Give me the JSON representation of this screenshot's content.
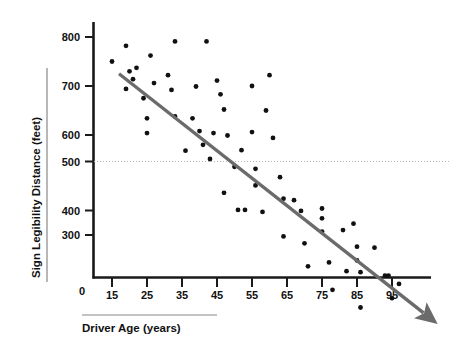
{
  "chart_data": {
    "type": "scatter",
    "title": "",
    "xlabel": "Driver Age (years)",
    "ylabel": "Sign Legibility Distance (feet)",
    "xlim": [
      5,
      105
    ],
    "ylim": [
      200,
      830
    ],
    "x_ticks": [
      15,
      25,
      35,
      45,
      55,
      65,
      75,
      85,
      95
    ],
    "y_ticks": [
      300,
      400,
      500,
      600,
      700,
      800
    ],
    "origin_label": "0",
    "grid": false,
    "legend": null,
    "reference_line": {
      "orientation": "horizontal",
      "value": 500,
      "style": "dotted",
      "color": "#b0b0b0"
    },
    "trend_line": {
      "style": "solid-arrow",
      "color": "#6b6b6b",
      "start": [
        17,
        725
      ],
      "end": [
        104,
        237
      ],
      "description": "negative linear trend with arrowhead at right end"
    },
    "point_color": "#111111",
    "point_radius": 2.4,
    "points": [
      {
        "x": 15,
        "y": 750
      },
      {
        "x": 19,
        "y": 782
      },
      {
        "x": 19,
        "y": 694
      },
      {
        "x": 20,
        "y": 730
      },
      {
        "x": 21,
        "y": 714
      },
      {
        "x": 22,
        "y": 737
      },
      {
        "x": 24,
        "y": 675
      },
      {
        "x": 25,
        "y": 634
      },
      {
        "x": 25,
        "y": 604
      },
      {
        "x": 26,
        "y": 762
      },
      {
        "x": 27,
        "y": 706
      },
      {
        "x": 31,
        "y": 722
      },
      {
        "x": 32,
        "y": 692
      },
      {
        "x": 33,
        "y": 791
      },
      {
        "x": 33,
        "y": 638
      },
      {
        "x": 36,
        "y": 568
      },
      {
        "x": 38,
        "y": 634
      },
      {
        "x": 39,
        "y": 699
      },
      {
        "x": 40,
        "y": 608
      },
      {
        "x": 41,
        "y": 580
      },
      {
        "x": 42,
        "y": 791
      },
      {
        "x": 43,
        "y": 551
      },
      {
        "x": 44,
        "y": 604
      },
      {
        "x": 45,
        "y": 711
      },
      {
        "x": 46,
        "y": 683
      },
      {
        "x": 47,
        "y": 652
      },
      {
        "x": 47,
        "y": 482
      },
      {
        "x": 48,
        "y": 599
      },
      {
        "x": 50,
        "y": 535
      },
      {
        "x": 51,
        "y": 447
      },
      {
        "x": 52,
        "y": 569
      },
      {
        "x": 53,
        "y": 447
      },
      {
        "x": 55,
        "y": 700
      },
      {
        "x": 55,
        "y": 606
      },
      {
        "x": 56,
        "y": 531
      },
      {
        "x": 56,
        "y": 497
      },
      {
        "x": 58,
        "y": 443
      },
      {
        "x": 59,
        "y": 650
      },
      {
        "x": 60,
        "y": 722
      },
      {
        "x": 61,
        "y": 594
      },
      {
        "x": 63,
        "y": 514
      },
      {
        "x": 64,
        "y": 470
      },
      {
        "x": 64,
        "y": 393
      },
      {
        "x": 67,
        "y": 467
      },
      {
        "x": 69,
        "y": 445
      },
      {
        "x": 70,
        "y": 379
      },
      {
        "x": 71,
        "y": 332
      },
      {
        "x": 75,
        "y": 450
      },
      {
        "x": 75,
        "y": 430
      },
      {
        "x": 75,
        "y": 403
      },
      {
        "x": 77,
        "y": 340
      },
      {
        "x": 78,
        "y": 284
      },
      {
        "x": 81,
        "y": 406
      },
      {
        "x": 82,
        "y": 322
      },
      {
        "x": 84,
        "y": 419
      },
      {
        "x": 85,
        "y": 372
      },
      {
        "x": 85,
        "y": 344
      },
      {
        "x": 86,
        "y": 320
      },
      {
        "x": 86,
        "y": 248
      },
      {
        "x": 90,
        "y": 370
      },
      {
        "x": 93,
        "y": 313
      },
      {
        "x": 94,
        "y": 313
      },
      {
        "x": 95,
        "y": 267
      },
      {
        "x": 97,
        "y": 296
      }
    ]
  }
}
